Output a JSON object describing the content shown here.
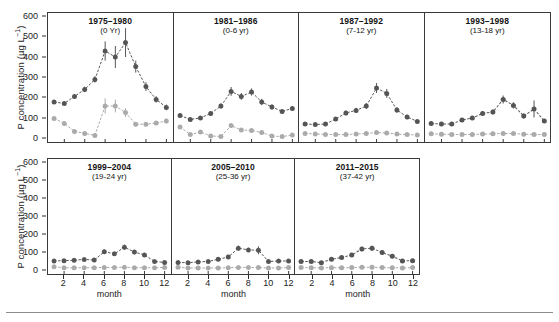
{
  "axes": {
    "y_title_main": "P concentration (",
    "y_title_unit": "µg L",
    "y_title_sup": "−1",
    "y_title_close": ")",
    "y_title_full": "P concentration (µg L−1)",
    "x_title": "month",
    "y_ticks": [
      0,
      100,
      200,
      300,
      400,
      500,
      600
    ],
    "x_ticks": [
      2,
      4,
      6,
      8,
      10,
      12
    ]
  },
  "style": {
    "series_dark_color": "#555555",
    "series_light_color": "#aaaaaa",
    "axis_color": "#3a3a3a",
    "rule_color": "#8c8c8c"
  },
  "chart_data": {
    "type": "line",
    "title": "",
    "xlabel": "month",
    "ylabel": "P concentration (µg L−1)",
    "xlim": [
      0.4,
      12.6
    ],
    "ylim": [
      -25,
      620
    ],
    "grid": false,
    "legend": "none",
    "x": [
      1,
      2,
      3,
      4,
      5,
      6,
      7,
      8,
      9,
      10,
      11,
      12
    ],
    "panels": [
      {
        "row": 1,
        "title": "1975–1980",
        "subtitle": "(0 Yr)",
        "series": [
          {
            "name": "dark",
            "color": "#555555",
            "values": [
              175,
              168,
              203,
              238,
              288,
              430,
              400,
              472,
              352,
              252,
              188,
              148
            ],
            "errors": [
              10,
              10,
              12,
              14,
              16,
              48,
              55,
              72,
              30,
              22,
              16,
              14
            ]
          },
          {
            "name": "light",
            "color": "#aaaaaa",
            "values": [
              93,
              68,
              28,
              18,
              8,
              155,
              155,
              122,
              64,
              64,
              70,
              80
            ],
            "errors": [
              10,
              9,
              8,
              7,
              6,
              38,
              32,
              22,
              10,
              10,
              10,
              12
            ]
          }
        ]
      },
      {
        "row": 1,
        "title": "1981–1986",
        "subtitle": "(0-6 yr)",
        "series": [
          {
            "name": "dark",
            "color": "#555555",
            "values": [
              107,
              88,
              95,
              118,
              155,
              228,
              203,
              225,
              175,
              150,
              128,
              143
            ],
            "errors": [
              10,
              9,
              9,
              11,
              13,
              22,
              17,
              18,
              16,
              13,
              12,
              12
            ]
          },
          {
            "name": "light",
            "color": "#aaaaaa",
            "values": [
              50,
              12,
              25,
              5,
              3,
              57,
              35,
              33,
              22,
              5,
              2,
              10
            ],
            "errors": [
              8,
              6,
              7,
              5,
              5,
              12,
              9,
              9,
              8,
              5,
              4,
              6
            ]
          }
        ]
      },
      {
        "row": 1,
        "title": "1987–1992",
        "subtitle": "(7-12 yr)",
        "series": [
          {
            "name": "dark",
            "color": "#555555",
            "values": [
              65,
              62,
              65,
              90,
              120,
              133,
              155,
              245,
              218,
              135,
              100,
              78
            ],
            "errors": [
              8,
              8,
              8,
              10,
              12,
              13,
              15,
              25,
              22,
              14,
              11,
              9
            ]
          },
          {
            "name": "light",
            "color": "#aaaaaa",
            "values": [
              18,
              15,
              13,
              12,
              12,
              15,
              18,
              22,
              20,
              15,
              12,
              10
            ],
            "errors": [
              5,
              5,
              5,
              5,
              5,
              5,
              6,
              6,
              6,
              5,
              5,
              5
            ]
          }
        ]
      },
      {
        "row": 1,
        "title": "1993–1998",
        "subtitle": "(13-18 yr)",
        "series": [
          {
            "name": "dark",
            "color": "#555555",
            "values": [
              68,
              65,
              65,
              85,
              95,
              118,
              125,
              188,
              158,
              105,
              140,
              80
            ],
            "errors": [
              8,
              8,
              8,
              9,
              10,
              12,
              12,
              20,
              16,
              12,
              42,
              10
            ]
          },
          {
            "name": "light",
            "color": "#aaaaaa",
            "values": [
              16,
              14,
              13,
              13,
              13,
              15,
              16,
              18,
              17,
              14,
              13,
              12
            ],
            "errors": [
              5,
              5,
              5,
              5,
              5,
              5,
              5,
              6,
              5,
              5,
              5,
              5
            ]
          }
        ]
      },
      {
        "row": 2,
        "title": "1999–2004",
        "subtitle": "(19-24 yr)",
        "series": [
          {
            "name": "dark",
            "color": "#555555",
            "values": [
              48,
              50,
              52,
              57,
              53,
              100,
              88,
              125,
              98,
              82,
              45,
              40
            ],
            "errors": [
              7,
              7,
              7,
              8,
              8,
              13,
              11,
              15,
              12,
              11,
              7,
              7
            ]
          },
          {
            "name": "light",
            "color": "#aaaaaa",
            "values": [
              15,
              10,
              10,
              10,
              10,
              12,
              12,
              13,
              10,
              10,
              10,
              12
            ],
            "errors": [
              5,
              4,
              4,
              4,
              4,
              5,
              5,
              5,
              4,
              4,
              4,
              5
            ]
          }
        ]
      },
      {
        "row": 2,
        "title": "2005–2010",
        "subtitle": "(25-36 yr)",
        "series": [
          {
            "name": "dark",
            "color": "#555555",
            "values": [
              40,
              38,
              43,
              45,
              58,
              70,
              120,
              110,
              108,
              45,
              48,
              48
            ],
            "errors": [
              7,
              7,
              7,
              7,
              8,
              10,
              14,
              12,
              22,
              8,
              8,
              9
            ]
          },
          {
            "name": "light",
            "color": "#aaaaaa",
            "values": [
              13,
              9,
              9,
              9,
              9,
              10,
              12,
              12,
              11,
              9,
              9,
              11
            ],
            "errors": [
              4,
              4,
              4,
              4,
              4,
              4,
              5,
              5,
              5,
              4,
              4,
              5
            ]
          }
        ]
      },
      {
        "row": 2,
        "title": "2011–2015",
        "subtitle": "(37-42 yr)",
        "series": [
          {
            "name": "dark",
            "color": "#555555",
            "values": [
              45,
              45,
              38,
              58,
              68,
              82,
              115,
              120,
              95,
              75,
              48,
              50
            ],
            "errors": [
              7,
              7,
              7,
              8,
              9,
              10,
              13,
              14,
              12,
              10,
              8,
              8
            ]
          },
          {
            "name": "light",
            "color": "#aaaaaa",
            "values": [
              12,
              10,
              9,
              10,
              10,
              11,
              13,
              13,
              11,
              10,
              9,
              11
            ],
            "errors": [
              4,
              4,
              4,
              4,
              4,
              4,
              5,
              5,
              5,
              4,
              4,
              5
            ]
          }
        ]
      }
    ]
  }
}
